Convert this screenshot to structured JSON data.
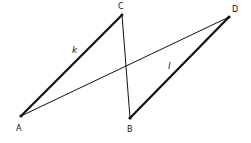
{
  "diagram": {
    "title": "",
    "points": {
      "A": {
        "label": "A",
        "x": 21,
        "y": 116
      },
      "B": {
        "label": "B",
        "x": 130,
        "y": 118
      },
      "C": {
        "label": "C",
        "x": 122,
        "y": 15
      },
      "D": {
        "label": "D",
        "x": 229,
        "y": 17
      }
    },
    "segments": [
      {
        "from": "A",
        "to": "C",
        "weight": "thick",
        "label": "k"
      },
      {
        "from": "B",
        "to": "D",
        "weight": "thick",
        "label": "l"
      },
      {
        "from": "A",
        "to": "D",
        "weight": "thin",
        "label": ""
      },
      {
        "from": "C",
        "to": "B",
        "weight": "thin",
        "label": ""
      }
    ],
    "segment_labels": {
      "k": "k",
      "l": "l"
    },
    "colors": {
      "line": "#111111",
      "background": "#ffffff"
    }
  }
}
